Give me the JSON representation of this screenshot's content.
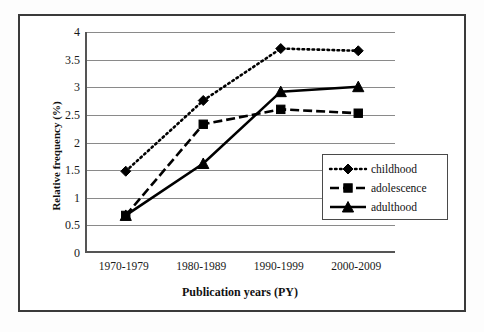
{
  "figure": {
    "border_color": "#3a3a3a",
    "background": "#ffffff"
  },
  "axes": {
    "y_title": "Relative frequency (%)",
    "x_title": "Publication years (PY)",
    "y_ticks": [
      "4",
      "3.5",
      "3",
      "2.5",
      "2",
      "1.5",
      "1",
      "0.5",
      "0"
    ],
    "x_ticks": [
      "1970-1979",
      "1980-1989",
      "1990-1999",
      "2000-2009"
    ]
  },
  "legend": {
    "items": [
      {
        "label": "childhood",
        "marker": "diamond-marker-icon",
        "line": "dotted"
      },
      {
        "label": "adolescence",
        "marker": "square-marker-icon",
        "line": "dashed"
      },
      {
        "label": "adulthood",
        "marker": "triangle-marker-icon",
        "line": "solid"
      }
    ]
  },
  "chart_data": {
    "type": "line",
    "title": "",
    "xlabel": "Publication years (PY)",
    "ylabel": "Relative frequency (%)",
    "categories": [
      "1970-1979",
      "1980-1989",
      "1990-1999",
      "2000-2009"
    ],
    "ylim": [
      0,
      4
    ],
    "ytick_step": 0.5,
    "grid": "horizontal",
    "legend_position": "inside-right-lower",
    "series": [
      {
        "name": "childhood",
        "marker": "diamond",
        "linestyle": "dotted",
        "color": "#000000",
        "values": [
          1.48,
          2.76,
          3.7,
          3.66
        ]
      },
      {
        "name": "adolescence",
        "marker": "square",
        "linestyle": "dashed",
        "color": "#000000",
        "values": [
          0.68,
          2.33,
          2.6,
          2.53
        ]
      },
      {
        "name": "adulthood",
        "marker": "triangle",
        "linestyle": "solid",
        "color": "#000000",
        "values": [
          0.68,
          1.62,
          2.92,
          3.01
        ]
      }
    ]
  }
}
